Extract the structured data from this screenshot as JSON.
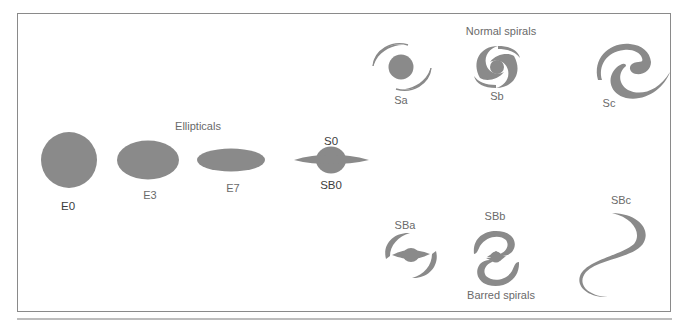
{
  "diagram": {
    "colors": {
      "shape_fill": "#8a8a8a",
      "frame": "#8a8a8a",
      "text": "#6a6a6a"
    },
    "groups": {
      "ellipticals": "Ellipticals",
      "normal_spirals": "Normal spirals",
      "barred_spirals": "Barred spirals"
    },
    "ellipticals": [
      {
        "id": "E0",
        "label": "E0"
      },
      {
        "id": "E3",
        "label": "E3"
      },
      {
        "id": "E7",
        "label": "E7"
      }
    ],
    "lenticular": {
      "top_label": "S0",
      "bottom_label": "SB0"
    },
    "normal_spirals": [
      {
        "id": "Sa",
        "label": "Sa"
      },
      {
        "id": "Sb",
        "label": "Sb"
      },
      {
        "id": "Sc",
        "label": "Sc"
      }
    ],
    "barred_spirals": [
      {
        "id": "SBa",
        "label": "SBa"
      },
      {
        "id": "SBb",
        "label": "SBb"
      },
      {
        "id": "SBc",
        "label": "SBc"
      }
    ]
  }
}
